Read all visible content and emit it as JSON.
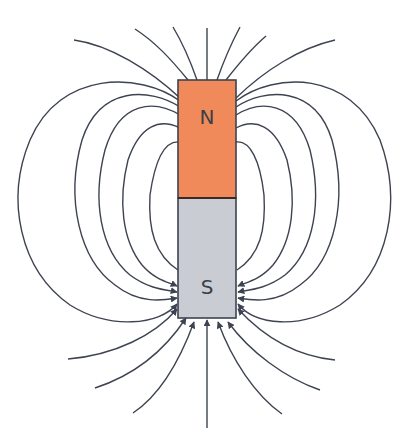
{
  "diagram": {
    "title": "",
    "magnet": {
      "north_label": "N",
      "south_label": "S",
      "north_color": "#f08a5a",
      "south_color": "#c9cdd3",
      "outline_color": "#3d4350"
    },
    "field_line_color": "#3d4350",
    "field_direction": "out of N pole, into S pole (arrowheads at S pole)"
  }
}
